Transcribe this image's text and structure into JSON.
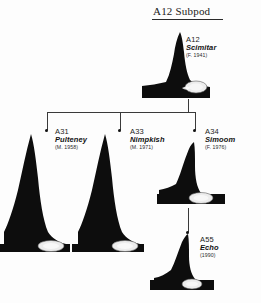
{
  "diagram": {
    "title": "A12 Subpod",
    "background_color": "#fdfdfd",
    "ink_color": "#111111",
    "saddle_color": "#e8e8e8",
    "line_color": "#3a3a3a"
  },
  "whales": {
    "a12": {
      "code": "A12",
      "name": "Scimitar",
      "date": "(F. 1941)"
    },
    "a31": {
      "code": "A31",
      "name": "Pulteney",
      "date": "(M. 1958)"
    },
    "a33": {
      "code": "A33",
      "name": "Nimpkish",
      "date": "(M. 1971)"
    },
    "a34": {
      "code": "A34",
      "name": "Simoom",
      "date": "(F. 1976)"
    },
    "a55": {
      "code": "A55",
      "name": "Echo",
      "date": "(1990)"
    }
  }
}
